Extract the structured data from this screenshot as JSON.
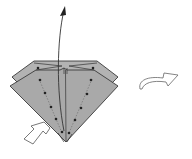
{
  "diagram": {
    "type": "origami-instruction-step",
    "colors": {
      "paper": "#a9a9a9",
      "paper_back": "#b3b3b3",
      "outline": "#3a3a3a",
      "dots": "#222222",
      "arrow_outline": "#555555",
      "arrow_fill": "#ffffff"
    },
    "elements": [
      {
        "name": "folded-model",
        "description": "Diamond-shaped folded paper with two layers"
      },
      {
        "name": "fold-up-arrow",
        "description": "Curved arrow pointing upward from bottom tip"
      },
      {
        "name": "push-arrow",
        "description": "Hollow arrow pointing into bottom-left edge"
      },
      {
        "name": "turn-over-arrow",
        "description": "Hollow curved arrow indicating turn over"
      },
      {
        "name": "dotted-guide-lines",
        "description": "Dotted lines with dots marking fold points"
      }
    ]
  }
}
